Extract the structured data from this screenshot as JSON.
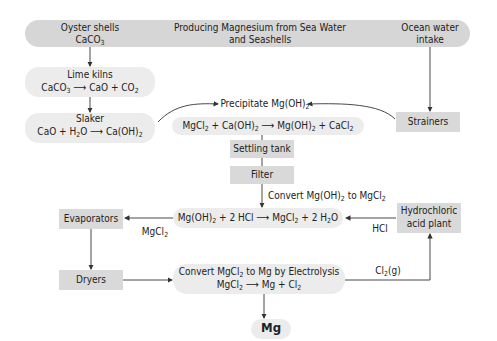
{
  "title": {
    "line1": "Producing Magnesium from Sea Water",
    "line2": "and Seashells"
  },
  "nodes": {
    "oyster": {
      "label": "Oyster shells",
      "formula": "CaCO<sub>3</sub>"
    },
    "ocean": {
      "label1": "Ocean water",
      "label2": "intake"
    },
    "lime_kilns": {
      "label": "Lime kilns",
      "formula": "CaCO<sub>3</sub> ⟶ CaO + CO<sub>2</sub>"
    },
    "slaker": {
      "label": "Slaker",
      "formula": "CaO + H<sub>2</sub>O ⟶ Ca(OH)<sub>2</sub>"
    },
    "precipitate": {
      "label": "Precipitate Mg(OH)<sub>2</sub>",
      "formula": "MgCl<sub>2</sub> + Ca(OH)<sub>2</sub> ⟶ Mg(OH)<sub>2</sub> + CaCl<sub>2</sub>"
    },
    "strainers": {
      "label": "Strainers"
    },
    "settling": {
      "label": "Settling tank"
    },
    "filter": {
      "label": "Filter"
    },
    "convert_hcl": {
      "label": "Convert Mg(OH)<sub>2</sub> to MgCl<sub>2</sub>",
      "formula": "Mg(OH)<sub>2</sub> + 2 HCl ⟶ MgCl<sub>2</sub> + 2 H<sub>2</sub>O"
    },
    "evaporators": {
      "label": "Evaporators"
    },
    "hcl_plant": {
      "label1": "Hydrochloric",
      "label2": "acid plant"
    },
    "dryers": {
      "label": "Dryers"
    },
    "electrolysis": {
      "label": "Convert MgCl<sub>2</sub> to Mg by Electrolysis",
      "formula": "MgCl<sub>2</sub> ⟶ Mg + Cl<sub>2</sub>"
    },
    "mg": {
      "label": "Mg"
    }
  },
  "edge_labels": {
    "mgcl2": "MgCl<sub>2</sub>",
    "hcl": "HCl",
    "cl2": "Cl<sub>2</sub>(g)"
  },
  "colors": {
    "pill_dark": "#d6d6d6",
    "pill_light": "#ececec",
    "box": "#d9d9d9",
    "line": "#333333"
  }
}
